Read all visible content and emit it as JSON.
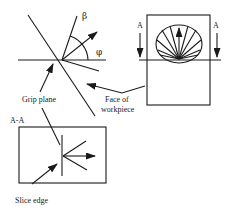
{
  "diagram": {
    "labels": {
      "beta": "β",
      "phi": "φ",
      "grip_plane": "Grip plane",
      "face_line1": "Face of",
      "face_line2": "workpiece",
      "section_left": "A",
      "section_right": "A",
      "section_view": "A-A",
      "slice_edge": "Slice edge"
    },
    "colors": {
      "stroke": "#1a1a1a",
      "background": "#ffffff"
    }
  }
}
